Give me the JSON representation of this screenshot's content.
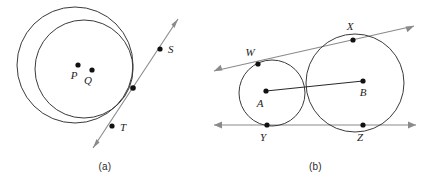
{
  "figure": {
    "panels": [
      {
        "id": "a",
        "caption": "(a)",
        "description": "Two internally tangent circles with a common tangent line",
        "circles": [
          {
            "name": "outer-circle",
            "cx": 75,
            "cy": 65,
            "r": 58,
            "stroke": "#3a3a3a"
          },
          {
            "name": "inner-circle",
            "cx": 84,
            "cy": 69,
            "r": 49,
            "stroke": "#3a3a3a"
          }
        ],
        "points": [
          {
            "label": "P",
            "name": "point-p",
            "x": 78,
            "y": 65,
            "lx": 74,
            "ly": 79
          },
          {
            "label": "Q",
            "name": "point-q",
            "x": 92,
            "y": 70,
            "lx": 88,
            "ly": 84
          },
          {
            "label": "S",
            "name": "point-s",
            "x": 160,
            "y": 49,
            "lx": 168,
            "ly": 53
          },
          {
            "label": "T",
            "name": "point-t",
            "x": 112,
            "y": 126,
            "lx": 120,
            "ly": 131
          },
          {
            "label": "",
            "name": "tangency-point",
            "x": 133,
            "y": 88,
            "lx": 0,
            "ly": 0
          }
        ],
        "tangent_line": {
          "name": "tangent-line-st",
          "x1": 93,
          "y1": 148,
          "x2": 178,
          "y2": 19,
          "stroke": "#8a8a8a",
          "arrows": "both"
        }
      },
      {
        "id": "b",
        "caption": "(b)",
        "description": "Two externally tangent circles with two common tangent lines",
        "circles": [
          {
            "name": "circle-a",
            "cx": 62,
            "cy": 93,
            "r": 33,
            "stroke": "#3a3a3a"
          },
          {
            "name": "circle-b",
            "cx": 145,
            "cy": 83,
            "r": 49,
            "stroke": "#3a3a3a"
          }
        ],
        "points": [
          {
            "label": "W",
            "name": "point-w",
            "x": 48,
            "y": 64,
            "lx": 40,
            "ly": 56
          },
          {
            "label": "X",
            "name": "point-x",
            "x": 143,
            "y": 40,
            "lx": 140,
            "ly": 30
          },
          {
            "label": "A",
            "name": "center-a",
            "x": 56,
            "y": 91,
            "lx": 50,
            "ly": 107
          },
          {
            "label": "B",
            "name": "center-b",
            "x": 153,
            "y": 81,
            "lx": 150,
            "ly": 96
          },
          {
            "label": "Y",
            "name": "point-y",
            "x": 57,
            "y": 125,
            "lx": 53,
            "ly": 141
          },
          {
            "label": "Z",
            "name": "point-z",
            "x": 153,
            "y": 125,
            "lx": 149,
            "ly": 141
          }
        ],
        "center_segment": {
          "name": "segment-ab",
          "x1": 56,
          "y1": 91,
          "x2": 153,
          "y2": 81,
          "stroke": "#2a2a2a"
        },
        "tangent_lines": [
          {
            "name": "upper-tangent-line-wx",
            "x1": 4,
            "y1": 71,
            "x2": 204,
            "y2": 26,
            "stroke": "#8a8a8a",
            "arrows": "both"
          },
          {
            "name": "lower-tangent-line-yz",
            "x1": 4,
            "y1": 125,
            "x2": 206,
            "y2": 125,
            "stroke": "#8a8a8a",
            "arrows": "both"
          }
        ]
      }
    ]
  },
  "style": {
    "point_fill": "#111111",
    "point_radius": 2.6,
    "background": "#ffffff"
  }
}
